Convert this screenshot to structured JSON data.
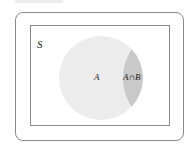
{
  "diagram": {
    "type": "venn",
    "sample_space_label": "S",
    "set_a_label": "A",
    "intersection_label": "A∩B",
    "colors": {
      "set_a_fill": "#ececec",
      "intersection_fill": "#c9c9c9",
      "border": "#8a8a8a"
    }
  }
}
